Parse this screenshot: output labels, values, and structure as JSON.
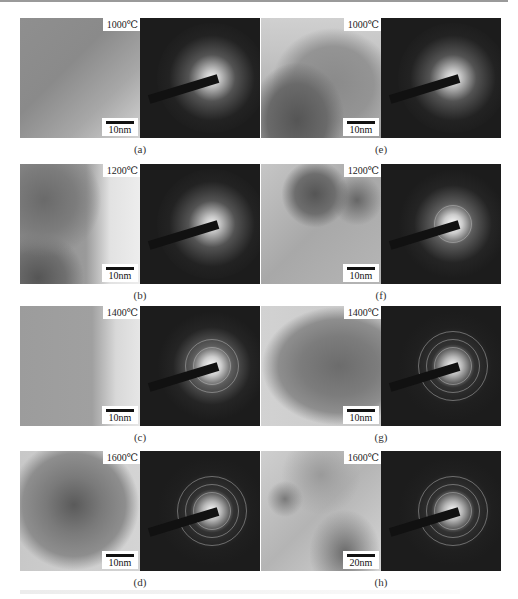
{
  "figure": {
    "panels": [
      {
        "id": "a",
        "label": "(a)",
        "temperature": "1000℃",
        "scale_bar": "10nm",
        "column": "left",
        "row": 1,
        "tem_background": "linear-gradient(135deg,#8f8f8f 0%,#8a8a8a 40%,#a7a7a7 70%,#d4d4d4 100%)",
        "saed_rings": 0,
        "halo_strength": "weak"
      },
      {
        "id": "b",
        "label": "(b)",
        "temperature": "1200℃",
        "scale_bar": "10nm",
        "column": "left",
        "row": 2,
        "tem_background": "radial-gradient(circle at 20% 30%,#6a6a6a 0,#7c7c7c 25%,transparent 45%),radial-gradient(circle at 15% 95%,#555 0,#6f6f6f 18%,transparent 30%),linear-gradient(90deg,#8e8e8e 0%,#9a9a9a 55%,#e2e2e2 75%,#ededed 100%)",
        "saed_rings": 0,
        "halo_strength": "weak"
      },
      {
        "id": "c",
        "label": "(c)",
        "temperature": "1400℃",
        "scale_bar": "10nm",
        "column": "left",
        "row": 3,
        "tem_background": "linear-gradient(90deg,#9c9c9c 0%,#a0a0a0 60%,#d8d8d8 80%,#e6e6e6 100%)",
        "saed_rings": 2,
        "halo_strength": "medium"
      },
      {
        "id": "d",
        "label": "(d)",
        "temperature": "1600℃",
        "scale_bar": "10nm",
        "column": "left",
        "row": 4,
        "tem_background": "radial-gradient(ellipse at 45% 45%,#5a5a5a 0,#7a7a7a 30%,#8e8e8e 55%,transparent 70%),linear-gradient(90deg,#c8c8c8 0%,#d4d4d4 100%)",
        "saed_rings": 3,
        "halo_strength": "strong"
      },
      {
        "id": "e",
        "label": "(e)",
        "temperature": "1000℃",
        "scale_bar": "10nm",
        "column": "right",
        "row": 1,
        "tem_background": "radial-gradient(ellipse at 30% 85%,#555 0,#6a6a6a 25%,transparent 40%),radial-gradient(ellipse at 60% 55%,#8a8a8a 0,#949494 40%,transparent 60%),linear-gradient(180deg,#d0d0d0 0%,#c4c4c4 30%,#a0a0a0 100%)",
        "saed_rings": 0,
        "halo_strength": "weak"
      },
      {
        "id": "f",
        "label": "(f)",
        "temperature": "1200℃",
        "scale_bar": "10nm",
        "column": "right",
        "row": 2,
        "tem_background": "radial-gradient(circle at 45% 25%,#555 0,#6e6e6e 18%,transparent 30%),radial-gradient(circle at 80% 30%,#666 0,transparent 20%),linear-gradient(135deg,#c6c6c6 0%,#a8a8a8 50%,#b6b6b6 100%)",
        "saed_rings": 1,
        "halo_strength": "medium"
      },
      {
        "id": "g",
        "label": "(g)",
        "temperature": "1400℃",
        "scale_bar": "10nm",
        "column": "right",
        "row": 3,
        "tem_background": "radial-gradient(ellipse at 65% 50%,#6c6c6c 0,#7c7c7c 35%,#8e8e8e 55%,transparent 70%),linear-gradient(90deg,#d2d2d2 0%,#c8c8c8 100%)",
        "saed_rings": 3,
        "halo_strength": "strong"
      },
      {
        "id": "h",
        "label": "(h)",
        "temperature": "1600℃",
        "scale_bar": "20nm",
        "column": "right",
        "row": 4,
        "tem_background": "radial-gradient(circle at 20% 40%,#7a7a7a 0,transparent 15%),radial-gradient(ellipse at 70% 85%,#6a6a6a 0,transparent 30%),radial-gradient(circle at 50% 20%,#9a9a9a 0,transparent 35%),linear-gradient(135deg,#cfcfcf 0%,#b4b4b4 50%,#d6d6d6 100%)",
        "saed_rings": 3,
        "halo_strength": "strong"
      }
    ]
  }
}
